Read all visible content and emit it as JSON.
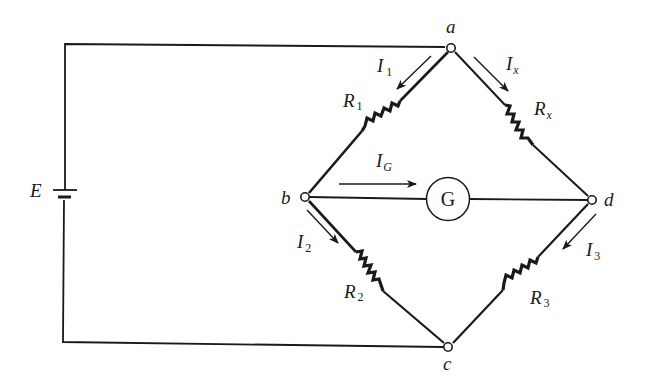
{
  "diagram": {
    "source": {
      "label": "E"
    },
    "nodes": [
      {
        "id": "a",
        "label": "a"
      },
      {
        "id": "b",
        "label": "b"
      },
      {
        "id": "c",
        "label": "c"
      },
      {
        "id": "d",
        "label": "d"
      }
    ],
    "resistors": [
      {
        "id": "R1",
        "main": "R",
        "sub": "1",
        "between": [
          "a",
          "b"
        ]
      },
      {
        "id": "Rx",
        "main": "R",
        "sub": "x",
        "between": [
          "a",
          "d"
        ]
      },
      {
        "id": "R2",
        "main": "R",
        "sub": "2",
        "between": [
          "b",
          "c"
        ]
      },
      {
        "id": "R3",
        "main": "R",
        "sub": "3",
        "between": [
          "d",
          "c"
        ]
      }
    ],
    "galvanometer": {
      "label": "G",
      "between": [
        "b",
        "d"
      ]
    },
    "currents": [
      {
        "id": "I1",
        "main": "I",
        "sub": "1",
        "direction": "a to b"
      },
      {
        "id": "Ix",
        "main": "I",
        "sub": "x",
        "direction": "a to d"
      },
      {
        "id": "IG",
        "main": "I",
        "sub": "G",
        "direction": "b to d"
      },
      {
        "id": "I2",
        "main": "I",
        "sub": "2",
        "direction": "b to c"
      },
      {
        "id": "I3",
        "main": "I",
        "sub": "3",
        "direction": "d to c"
      }
    ],
    "colors": {
      "ink": "#1a1a1a",
      "background": "#ffffff"
    }
  }
}
